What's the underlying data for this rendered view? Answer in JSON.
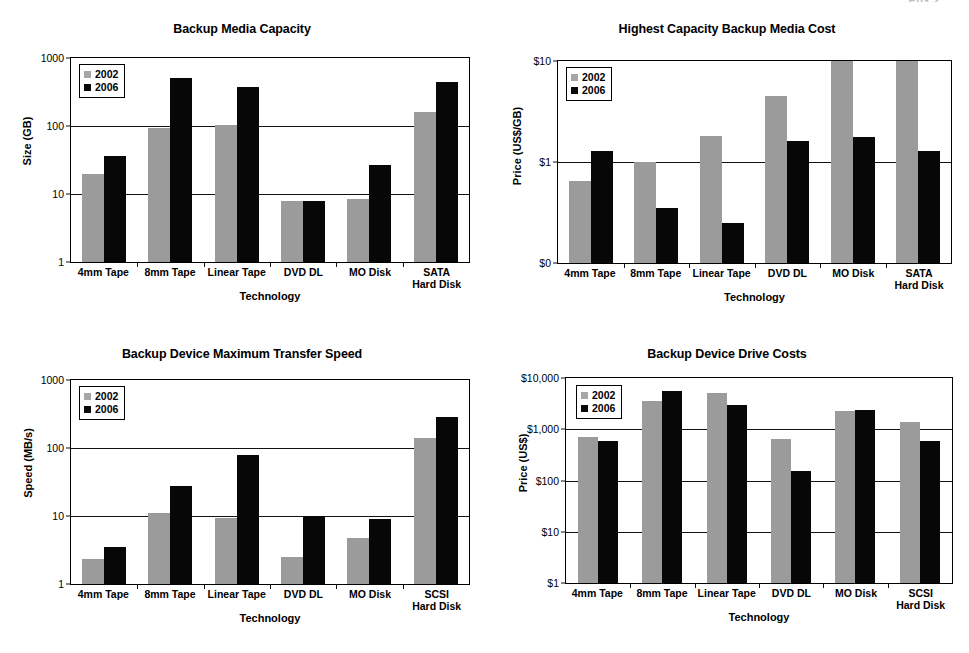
{
  "page": {
    "header_fragment": "FIG 2",
    "series_colors": {
      "2002": "#9b9b9b",
      "2006": "#070707"
    },
    "legend_labels": {
      "2002": "2002",
      "2006": "2006"
    }
  },
  "chart_data": [
    {
      "id": "backup-media-capacity",
      "position": "top-left",
      "type": "bar",
      "title": "Backup Media Capacity",
      "xlabel": "Technology",
      "ylabel": "Size (GB)",
      "yscale": "log",
      "ylim": [
        1,
        1000
      ],
      "yticks": [
        "1",
        "10",
        "100",
        "1000"
      ],
      "grid": true,
      "legend": [
        "2002",
        "2006"
      ],
      "legend_position": "top-left inside",
      "categories": [
        "4mm Tape",
        "8mm Tape",
        "Linear Tape",
        "DVD DL",
        "MO Disk",
        "SATA\nHard Disk"
      ],
      "series": [
        {
          "name": "2002",
          "values": [
            20,
            95,
            105,
            8,
            8.5,
            160
          ]
        },
        {
          "name": "2006",
          "values": [
            36,
            500,
            380,
            8,
            27,
            450
          ]
        }
      ]
    },
    {
      "id": "highest-capacity-backup-media-cost",
      "position": "top-right",
      "type": "bar",
      "title": "Highest Capacity Backup Media Cost",
      "xlabel": "Technology",
      "ylabel": "Price (US$/GB)",
      "yscale": "log",
      "ylim": [
        0.1,
        10
      ],
      "yticks": [
        "$0",
        "$1",
        "$10"
      ],
      "grid": true,
      "legend": [
        "2002",
        "2006"
      ],
      "legend_position": "top-left inside",
      "categories": [
        "4mm Tape",
        "8mm Tape",
        "Linear Tape",
        "DVD DL",
        "MO Disk",
        "SATA\nHard Disk"
      ],
      "series": [
        {
          "name": "2002",
          "values": [
            0.65,
            1.0,
            1.8,
            4.5,
            10,
            10
          ]
        },
        {
          "name": "2006",
          "values": [
            1.3,
            0.35,
            0.25,
            1.6,
            1.75,
            1.3
          ]
        }
      ]
    },
    {
      "id": "backup-device-maximum-transfer-speed",
      "position": "bottom-left",
      "type": "bar",
      "title": "Backup Device Maximum Transfer Speed",
      "xlabel": "Technology",
      "ylabel": "Speed (MB/s)",
      "yscale": "log",
      "ylim": [
        1,
        1000
      ],
      "yticks": [
        "1",
        "10",
        "100",
        "1000"
      ],
      "grid": true,
      "legend": [
        "2002",
        "2006"
      ],
      "legend_position": "top-left inside",
      "categories": [
        "4mm Tape",
        "8mm Tape",
        "Linear Tape",
        "DVD DL",
        "MO Disk",
        "SCSI\nHard Disk"
      ],
      "series": [
        {
          "name": "2002",
          "values": [
            2.3,
            11,
            9.5,
            2.5,
            4.7,
            140
          ]
        },
        {
          "name": "2006",
          "values": [
            3.5,
            28,
            78,
            10,
            9,
            290
          ]
        }
      ]
    },
    {
      "id": "backup-device-drive-costs",
      "position": "bottom-right",
      "type": "bar",
      "title": "Backup Device Drive Costs",
      "xlabel": "Technology",
      "ylabel": "Price (US$)",
      "yscale": "log",
      "ylim": [
        1,
        10000
      ],
      "yticks": [
        "$1",
        "$10",
        "$100",
        "$1,000",
        "$10,000"
      ],
      "grid": true,
      "legend": [
        "2002",
        "2006"
      ],
      "legend_position": "top-left inside",
      "categories": [
        "4mm Tape",
        "8mm Tape",
        "Linear Tape",
        "DVD DL",
        "MO Disk",
        "SCSI\nHard Disk"
      ],
      "series": [
        {
          "name": "2002",
          "values": [
            700,
            3500,
            5000,
            650,
            2300,
            1400
          ]
        },
        {
          "name": "2006",
          "values": [
            600,
            5500,
            3000,
            150,
            2400,
            600
          ]
        }
      ]
    }
  ]
}
